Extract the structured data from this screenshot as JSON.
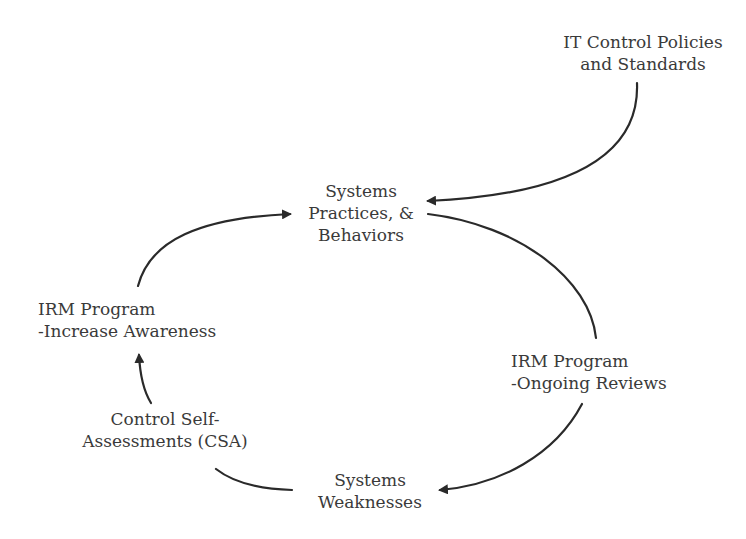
{
  "diagram": {
    "type": "cycle-diagram",
    "nodes": [
      {
        "id": "it-control-policies",
        "lines": [
          "IT Control Policies",
          "and Standards"
        ]
      },
      {
        "id": "systems-practices",
        "lines": [
          "Systems",
          "Practices, &",
          "Behaviors"
        ]
      },
      {
        "id": "irm-ongoing-reviews",
        "lines": [
          "IRM Program",
          "-Ongoing Reviews"
        ]
      },
      {
        "id": "systems-weaknesses",
        "lines": [
          "Systems",
          "Weaknesses"
        ]
      },
      {
        "id": "control-self-assessments",
        "lines": [
          "Control Self-",
          "Assessments (CSA)"
        ]
      },
      {
        "id": "irm-increase-awareness",
        "lines": [
          "IRM Program",
          "-Increase Awareness"
        ]
      }
    ],
    "edges": [
      {
        "from": "it-control-policies",
        "to": "systems-practices"
      },
      {
        "from": "systems-practices",
        "to": "irm-ongoing-reviews"
      },
      {
        "from": "irm-ongoing-reviews",
        "to": "systems-weaknesses"
      },
      {
        "from": "systems-weaknesses",
        "to": "control-self-assessments"
      },
      {
        "from": "control-self-assessments",
        "to": "irm-increase-awareness"
      },
      {
        "from": "irm-increase-awareness",
        "to": "systems-practices"
      }
    ],
    "stroke_color": "#2a2a2a",
    "text_color": "#3a3a3a"
  }
}
